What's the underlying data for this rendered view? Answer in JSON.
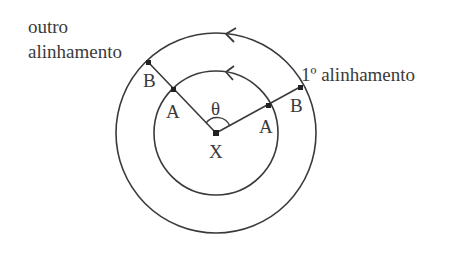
{
  "diagram": {
    "labels": {
      "outro_line1": "outro",
      "outro_line2": "alinhamento",
      "first_alignment": "1º alinhamento",
      "center": "X",
      "angle": "θ",
      "point_a_left": "A",
      "point_b_left": "B",
      "point_a_right": "A",
      "point_b_right": "B"
    },
    "colors": {
      "stroke": "#3a3a3a",
      "background": "#ffffff"
    },
    "geometry": {
      "center": [
        216,
        133
      ],
      "inner_radius": 62,
      "outer_radius": 100
    }
  }
}
